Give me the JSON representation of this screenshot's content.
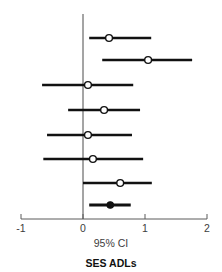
{
  "chart_data": {
    "type": "forest",
    "title": "SES ADLs",
    "xlabel": "95% CI",
    "ylabel": "",
    "xlim": [
      -1,
      2
    ],
    "xticks": [
      -1,
      0,
      1,
      2
    ],
    "xtick_labels": [
      "-1",
      "0",
      "1",
      "2"
    ],
    "grid": false,
    "legend": null,
    "reference_line": 0,
    "rows": [
      {
        "label": "",
        "estimate": 0.42,
        "ci_low": 0.1,
        "ci_high": 1.1,
        "marker": "open-circle",
        "summary": false
      },
      {
        "label": "",
        "estimate": 1.05,
        "ci_low": 0.31,
        "ci_high": 1.76,
        "marker": "open-circle",
        "summary": false
      },
      {
        "label": "",
        "estimate": 0.08,
        "ci_low": -0.66,
        "ci_high": 0.81,
        "marker": "open-circle",
        "summary": false
      },
      {
        "label": "",
        "estimate": 0.34,
        "ci_low": -0.24,
        "ci_high": 0.92,
        "marker": "open-circle",
        "summary": false
      },
      {
        "label": "",
        "estimate": 0.08,
        "ci_low": -0.58,
        "ci_high": 0.79,
        "marker": "open-circle",
        "summary": false
      },
      {
        "label": "",
        "estimate": 0.16,
        "ci_low": -0.64,
        "ci_high": 0.97,
        "marker": "open-circle",
        "summary": false
      },
      {
        "label": "",
        "estimate": 0.6,
        "ci_low": 0.0,
        "ci_high": 1.11,
        "marker": "open-circle",
        "summary": false
      },
      {
        "label": "",
        "estimate": 0.44,
        "ci_low": 0.1,
        "ci_high": 0.77,
        "marker": "filled-circle",
        "summary": true
      }
    ],
    "colors": {
      "line": "#111111",
      "marker_fill_open": "#ffffff",
      "marker_fill_summary": "#111111",
      "axis": "#5a5a5a",
      "reference": "#4a4a4a",
      "background": "#ffffff"
    }
  }
}
